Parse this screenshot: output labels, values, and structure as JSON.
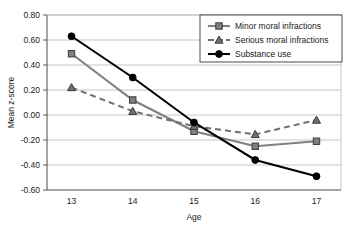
{
  "chart_data": {
    "type": "line",
    "title": "",
    "xlabel": "Age",
    "ylabel": "Mean z-score",
    "categories": [
      "13",
      "14",
      "15",
      "16",
      "17"
    ],
    "x": [
      13,
      14,
      15,
      16,
      17
    ],
    "xlim": [
      12.6,
      17.4
    ],
    "ylim": [
      -0.6,
      0.8
    ],
    "ytick_labels": [
      "0.80",
      "0.60",
      "0.40",
      "0.20",
      "0.00",
      "-0.20",
      "-0.40",
      "-0.60"
    ],
    "ytick_values": [
      0.8,
      0.6,
      0.4,
      0.2,
      0.0,
      -0.2,
      -0.4,
      -0.6
    ],
    "xtick_labels": [
      "13",
      "14",
      "15",
      "16",
      "17"
    ],
    "grid": "horizontal",
    "legend_position": "top-right",
    "series": [
      {
        "name": "Minor moral infractions",
        "values": [
          0.49,
          0.12,
          -0.13,
          -0.25,
          -0.21
        ],
        "color": "#808080",
        "marker": "square",
        "line_style": "solid"
      },
      {
        "name": "Serious moral infractions",
        "values": [
          0.22,
          0.03,
          -0.09,
          -0.155,
          -0.04
        ],
        "color": "#707070",
        "marker": "triangle",
        "line_style": "dashed"
      },
      {
        "name": "Substance use",
        "values": [
          0.63,
          0.3,
          -0.06,
          -0.36,
          -0.49
        ],
        "color": "#000000",
        "marker": "circle",
        "line_style": "solid"
      }
    ]
  },
  "colors": {
    "axis": "#4d4d4d",
    "grid": "#bfbfbf",
    "legend_border": "#4d4d4d",
    "background": "#ffffff",
    "text": "#1a1a1a"
  }
}
